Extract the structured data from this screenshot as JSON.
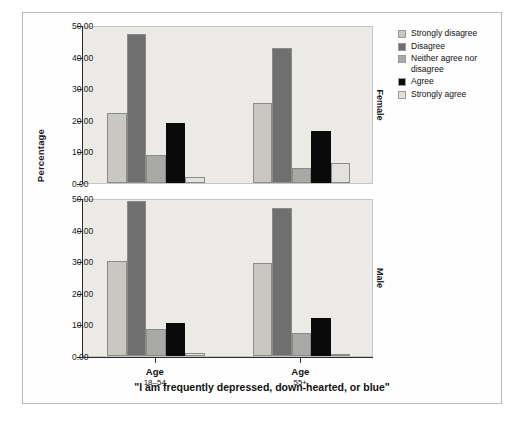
{
  "chart_data": {
    "type": "bar",
    "title": "\"I am frequently depressed, down-hearted, or blue\"",
    "xlabel": "",
    "ylabel": "Percentage",
    "ylim": [
      0,
      50
    ],
    "ytick_labels": [
      "0.00",
      "10.00",
      "20.00",
      "30.00",
      "40.00",
      "50.00"
    ],
    "ytick_values": [
      0,
      10,
      20,
      30,
      40,
      50
    ],
    "categories": [
      "Age 18-54",
      "Age 55+"
    ],
    "grid": false,
    "legend_position": "right",
    "panels": [
      {
        "strip_label": "Female",
        "groups": [
          {
            "category": "Age 18-54",
            "values": [
              22.0,
              47.0,
              8.9,
              19.0,
              2.0
            ]
          },
          {
            "category": "Age 55+",
            "values": [
              25.3,
              42.8,
              4.6,
              16.4,
              6.3
            ]
          }
        ]
      },
      {
        "strip_label": "Male",
        "groups": [
          {
            "category": "Age 18-54",
            "values": [
              30.0,
              49.0,
              8.5,
              10.5,
              1.0
            ]
          },
          {
            "category": "Age 55+",
            "values": [
              29.5,
              46.8,
              7.2,
              12.0,
              0.7
            ]
          }
        ]
      }
    ],
    "series": [
      {
        "name": "Strongly disagree",
        "color": "#c9c7c2"
      },
      {
        "name": "Disagree",
        "color": "#6f6f6f"
      },
      {
        "name": "Neither agree nor disagree",
        "color": "#a8a8a5"
      },
      {
        "name": "Agree",
        "color": "#0a0a0a"
      },
      {
        "name": "Strongly agree",
        "color": "#e3e1dd"
      }
    ]
  },
  "legend": {
    "items": [
      {
        "label": "Strongly disagree"
      },
      {
        "label": "Disagree"
      },
      {
        "label": "Neither agree nor disagree"
      },
      {
        "label": "Agree"
      },
      {
        "label": "Strongly agree"
      }
    ]
  },
  "xaxis": {
    "ticks": [
      {
        "line1": "Age",
        "line2": "18–54"
      },
      {
        "line1": "Age",
        "line2": "55+"
      }
    ]
  },
  "strips": {
    "top": "Female",
    "bottom": "Male"
  },
  "scan_caption": ""
}
